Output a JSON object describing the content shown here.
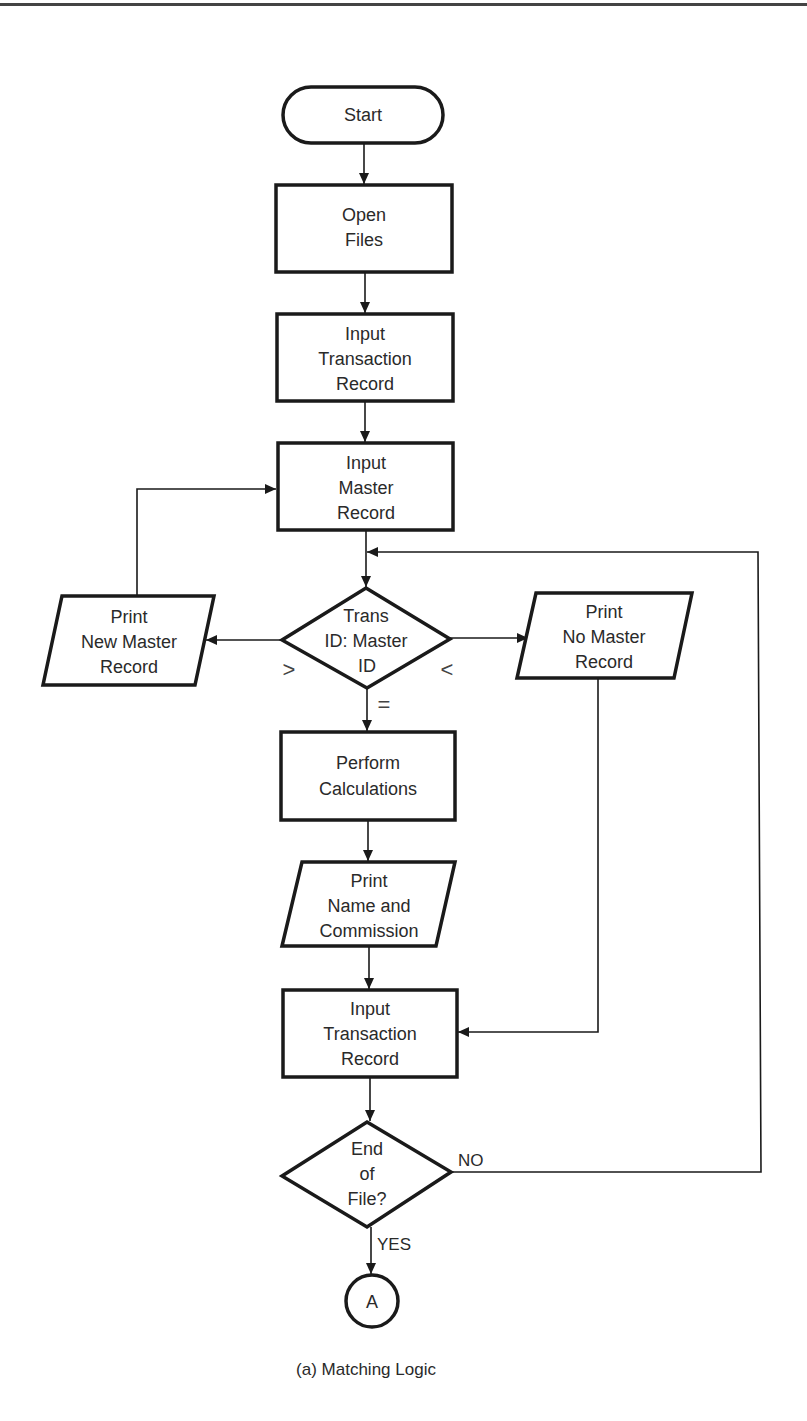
{
  "figure": {
    "caption": "(a)  Matching Logic",
    "nodes": {
      "start": {
        "type": "terminal",
        "lines": [
          "Start"
        ]
      },
      "open_files": {
        "type": "process",
        "lines": [
          "Open",
          "Files"
        ]
      },
      "input_transaction_1": {
        "type": "process",
        "lines": [
          "Input",
          "Transaction",
          "Record"
        ]
      },
      "input_master": {
        "type": "process",
        "lines": [
          "Input",
          "Master",
          "Record"
        ]
      },
      "compare_ids": {
        "type": "decision",
        "lines": [
          "Trans",
          "ID: Master",
          "ID"
        ]
      },
      "print_new_master": {
        "type": "io",
        "lines": [
          "Print",
          "New Master",
          "Record"
        ]
      },
      "print_no_master": {
        "type": "io",
        "lines": [
          "Print",
          "No Master",
          "Record"
        ]
      },
      "perform_calculations": {
        "type": "process",
        "lines": [
          "Perform",
          "Calculations"
        ]
      },
      "print_name_commission": {
        "type": "io",
        "lines": [
          "Print",
          "Name and",
          "Commission"
        ]
      },
      "input_transaction_2": {
        "type": "process",
        "lines": [
          "Input",
          "Transaction",
          "Record"
        ]
      },
      "end_of_file": {
        "type": "decision",
        "lines": [
          "End",
          "of",
          "File?"
        ]
      },
      "connector_a": {
        "type": "connector",
        "lines": [
          "A"
        ]
      }
    },
    "edge_labels": {
      "greater": ">",
      "less": "<",
      "equal": "=",
      "no": "NO",
      "yes": "YES"
    },
    "edges": [
      {
        "from": "start",
        "to": "open_files"
      },
      {
        "from": "open_files",
        "to": "input_transaction_1"
      },
      {
        "from": "input_transaction_1",
        "to": "input_master"
      },
      {
        "from": "input_master",
        "to": "compare_ids"
      },
      {
        "from": "compare_ids",
        "to": "print_new_master",
        "label": ">"
      },
      {
        "from": "compare_ids",
        "to": "print_no_master",
        "label": "<"
      },
      {
        "from": "compare_ids",
        "to": "perform_calculations",
        "label": "="
      },
      {
        "from": "print_new_master",
        "to": "input_master"
      },
      {
        "from": "print_no_master",
        "to": "input_transaction_2"
      },
      {
        "from": "perform_calculations",
        "to": "print_name_commission"
      },
      {
        "from": "print_name_commission",
        "to": "input_transaction_2"
      },
      {
        "from": "input_transaction_2",
        "to": "end_of_file"
      },
      {
        "from": "end_of_file",
        "to": "compare_ids",
        "label": "NO"
      },
      {
        "from": "end_of_file",
        "to": "connector_a",
        "label": "YES"
      }
    ]
  }
}
